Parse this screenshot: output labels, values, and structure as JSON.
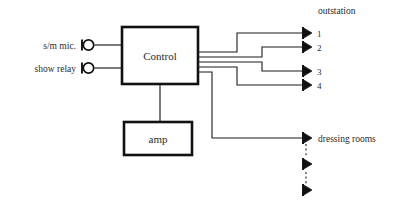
{
  "diagram": {
    "background_color": "#ffffff",
    "line_color": "#1a1a1a",
    "text_color": "#2b2b2b",
    "inputs": [
      {
        "label": "s/m mic.",
        "connector": "jack-socket"
      },
      {
        "label": "show relay",
        "connector": "jack-socket"
      }
    ],
    "blocks": [
      {
        "id": "control",
        "label": "Control"
      },
      {
        "id": "amp",
        "label": "amp"
      }
    ],
    "groups": [
      {
        "id": "outstation",
        "label": "outstation",
        "speakers": [
          {
            "number": "1"
          },
          {
            "number": "2"
          },
          {
            "number": "3"
          },
          {
            "number": "4"
          }
        ]
      },
      {
        "id": "dressing-rooms",
        "label": "dressing rooms",
        "speakers": [
          {
            "number": ""
          },
          {
            "number": ""
          },
          {
            "number": ""
          }
        ]
      }
    ]
  }
}
